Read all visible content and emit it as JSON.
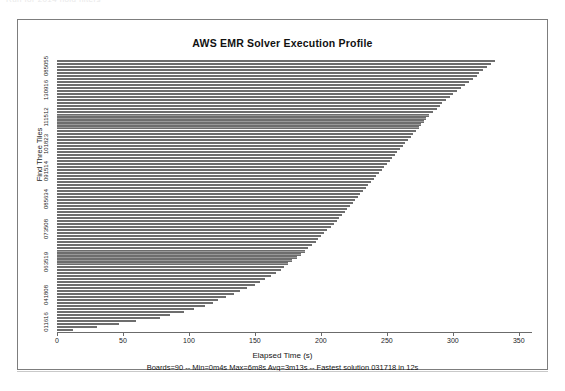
{
  "window": {
    "top_strip_text": "Run for 2014 hold filters"
  },
  "chart_data": {
    "type": "bar",
    "orientation": "horizontal",
    "title": "AWS EMR Solver Execution Profile",
    "xlabel": "Elapsed Time (s)",
    "ylabel": "Find Three Tiles",
    "caption": "Boards=90 -- Min=0m4s Max=6m8s Avg=3m13s -- Fastest solution 031718 in 12s",
    "xlim": [
      0,
      360
    ],
    "xticks": [
      0,
      50,
      100,
      150,
      200,
      250,
      300,
      350
    ],
    "xticklabels": [
      "0",
      "50",
      "100",
      "150",
      "200",
      "250",
      "300",
      "350"
    ],
    "grid": false,
    "legend": "none",
    "bar_color": "#9a9a9a",
    "bar_edge_color": "#6d6d6d",
    "yticklabels": [
      "011616",
      "041808",
      "063519",
      "073508",
      "085634",
      "091514",
      "101823",
      "111512",
      "130916",
      "085055"
    ],
    "ytick_positions": [
      2,
      11,
      22,
      33,
      43,
      52,
      61,
      70,
      79,
      87
    ],
    "categories": [
      "b01",
      "b02",
      "b03",
      "b04",
      "b05",
      "b06",
      "b07",
      "b08",
      "b09",
      "b10",
      "b11",
      "b12",
      "b13",
      "b14",
      "b15",
      "b16",
      "b17",
      "b18",
      "b19",
      "b20",
      "b21",
      "b22",
      "b23",
      "b24",
      "b25",
      "b26",
      "b27",
      "b28",
      "b29",
      "b30",
      "b31",
      "b32",
      "b33",
      "b34",
      "b35",
      "b36",
      "b37",
      "b38",
      "b39",
      "b40",
      "b41",
      "b42",
      "b43",
      "b44",
      "b45",
      "b46",
      "b47",
      "b48",
      "b49",
      "b50",
      "b51",
      "b52",
      "b53",
      "b54",
      "b55",
      "b56",
      "b57",
      "b58",
      "b59",
      "b60",
      "b61",
      "b62",
      "b63",
      "b64",
      "b65",
      "b66",
      "b67",
      "b68",
      "b69",
      "b70",
      "b71",
      "b72",
      "b73",
      "b74",
      "b75",
      "b76",
      "b77",
      "b78",
      "b79",
      "b80",
      "b81",
      "b82",
      "b83",
      "b84",
      "b85",
      "b86",
      "b87",
      "b88",
      "b89",
      "b90"
    ],
    "values": [
      12,
      30,
      47,
      60,
      78,
      86,
      96,
      104,
      112,
      118,
      122,
      128,
      134,
      139,
      144,
      150,
      154,
      158,
      162,
      166,
      170,
      172,
      175,
      178,
      182,
      185,
      188,
      190,
      193,
      196,
      198,
      200,
      202,
      205,
      208,
      210,
      212,
      214,
      216,
      218,
      220,
      222,
      224,
      226,
      228,
      230,
      232,
      234,
      236,
      238,
      240,
      242,
      244,
      246,
      248,
      250,
      252,
      254,
      256,
      258,
      260,
      262,
      264,
      266,
      268,
      270,
      272,
      274,
      276,
      278,
      280,
      282,
      285,
      288,
      290,
      292,
      295,
      298,
      300,
      303,
      306,
      309,
      312,
      315,
      318,
      320,
      323,
      326,
      329,
      332
    ],
    "values_sorted_descending_top_to_bottom": true
  }
}
